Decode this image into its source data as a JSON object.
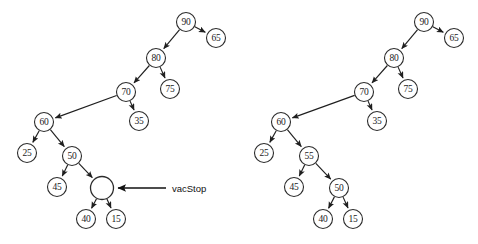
{
  "figure": {
    "type": "binary-tree-diagram",
    "background_color": "#ffffff",
    "node_stroke_color": "#2b2b2b",
    "edge_color": "#1f1f1f",
    "text_color": "#1a1a1a",
    "panel_count": 2
  },
  "annotations": [
    {
      "id": "vacstop",
      "label": "vacStop",
      "points_to": "empty-node",
      "arrow_from_x": 166,
      "arrow_from_y": 188,
      "arrow_to_x": 118,
      "arrow_to_y": 188,
      "label_x": 172,
      "label_y": 188
    }
  ],
  "left_tree": {
    "name": "before-tree",
    "nodes": [
      {
        "id": "L90",
        "label": "90",
        "x": 186,
        "y": 22,
        "r": 9.5,
        "empty": false
      },
      {
        "id": "L65",
        "label": "65",
        "x": 216,
        "y": 38,
        "r": 9.5,
        "empty": false
      },
      {
        "id": "L80",
        "label": "80",
        "x": 156,
        "y": 58,
        "r": 9.5,
        "empty": false
      },
      {
        "id": "L75",
        "label": "75",
        "x": 170,
        "y": 89,
        "r": 9.5,
        "empty": false
      },
      {
        "id": "L70",
        "label": "70",
        "x": 126,
        "y": 92,
        "r": 9.5,
        "empty": false
      },
      {
        "id": "L35",
        "label": "35",
        "x": 139,
        "y": 121,
        "r": 9.5,
        "empty": false
      },
      {
        "id": "L60",
        "label": "60",
        "x": 44,
        "y": 122,
        "r": 9.5,
        "empty": false
      },
      {
        "id": "L25",
        "label": "25",
        "x": 27,
        "y": 153,
        "r": 9.5,
        "empty": false
      },
      {
        "id": "L50",
        "label": "50",
        "x": 72,
        "y": 156,
        "r": 9.5,
        "empty": false
      },
      {
        "id": "L45",
        "label": "45",
        "x": 57,
        "y": 187,
        "r": 9.5,
        "empty": false
      },
      {
        "id": "LEMPTY",
        "label": "",
        "x": 102,
        "y": 188,
        "r": 11.5,
        "empty": true
      },
      {
        "id": "L40",
        "label": "40",
        "x": 86,
        "y": 219,
        "r": 9.5,
        "empty": false
      },
      {
        "id": "L15",
        "label": "15",
        "x": 116,
        "y": 219,
        "r": 9.5,
        "empty": false
      }
    ],
    "edges": [
      {
        "from": "L90",
        "to": "L80"
      },
      {
        "from": "L90",
        "to": "L65"
      },
      {
        "from": "L80",
        "to": "L70"
      },
      {
        "from": "L80",
        "to": "L75"
      },
      {
        "from": "L70",
        "to": "L60"
      },
      {
        "from": "L70",
        "to": "L35"
      },
      {
        "from": "L60",
        "to": "L25"
      },
      {
        "from": "L60",
        "to": "L50"
      },
      {
        "from": "L50",
        "to": "L45"
      },
      {
        "from": "L50",
        "to": "LEMPTY"
      },
      {
        "from": "LEMPTY",
        "to": "L40"
      },
      {
        "from": "LEMPTY",
        "to": "L15"
      }
    ]
  },
  "right_tree": {
    "name": "after-tree",
    "nodes": [
      {
        "id": "R90",
        "label": "90",
        "x": 424,
        "y": 22,
        "r": 9.5,
        "empty": false
      },
      {
        "id": "R65",
        "label": "65",
        "x": 454,
        "y": 38,
        "r": 9.5,
        "empty": false
      },
      {
        "id": "R80",
        "label": "80",
        "x": 394,
        "y": 58,
        "r": 9.5,
        "empty": false
      },
      {
        "id": "R75",
        "label": "75",
        "x": 408,
        "y": 89,
        "r": 9.5,
        "empty": false
      },
      {
        "id": "R70",
        "label": "70",
        "x": 364,
        "y": 92,
        "r": 9.5,
        "empty": false
      },
      {
        "id": "R35",
        "label": "35",
        "x": 377,
        "y": 121,
        "r": 9.5,
        "empty": false
      },
      {
        "id": "R60",
        "label": "60",
        "x": 281,
        "y": 122,
        "r": 9.5,
        "empty": false
      },
      {
        "id": "R25",
        "label": "25",
        "x": 264,
        "y": 153,
        "r": 9.5,
        "empty": false
      },
      {
        "id": "R55",
        "label": "55",
        "x": 309,
        "y": 156,
        "r": 9.5,
        "empty": false
      },
      {
        "id": "R45",
        "label": "45",
        "x": 294,
        "y": 187,
        "r": 9.5,
        "empty": false
      },
      {
        "id": "R50",
        "label": "50",
        "x": 339,
        "y": 188,
        "r": 9.5,
        "empty": false
      },
      {
        "id": "R40",
        "label": "40",
        "x": 323,
        "y": 219,
        "r": 9.5,
        "empty": false
      },
      {
        "id": "R15",
        "label": "15",
        "x": 353,
        "y": 219,
        "r": 9.5,
        "empty": false
      }
    ],
    "edges": [
      {
        "from": "R90",
        "to": "R80"
      },
      {
        "from": "R90",
        "to": "R65"
      },
      {
        "from": "R80",
        "to": "R70"
      },
      {
        "from": "R80",
        "to": "R75"
      },
      {
        "from": "R70",
        "to": "R60"
      },
      {
        "from": "R70",
        "to": "R35"
      },
      {
        "from": "R60",
        "to": "R25"
      },
      {
        "from": "R60",
        "to": "R55"
      },
      {
        "from": "R55",
        "to": "R45"
      },
      {
        "from": "R55",
        "to": "R50"
      },
      {
        "from": "R50",
        "to": "R40"
      },
      {
        "from": "R50",
        "to": "R15"
      }
    ]
  }
}
